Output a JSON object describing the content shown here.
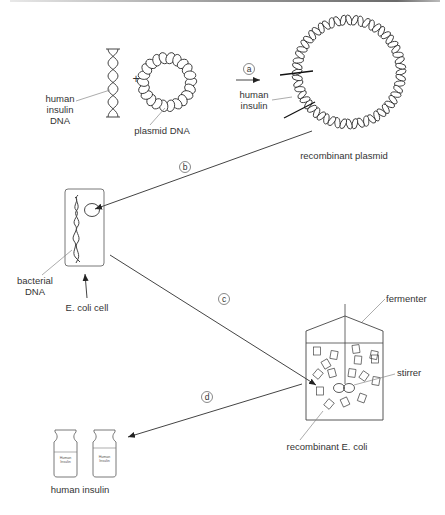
{
  "diagram": {
    "type": "process-flow",
    "colors": {
      "line": "#444444",
      "text": "#333333",
      "leader": "#888888",
      "background": "#ffffff"
    },
    "labels": {
      "human_insulin_dna": [
        "human",
        "insulin",
        "DNA"
      ],
      "plus": "+",
      "plasmid_dna": "plasmid DNA",
      "human_insulin_insert": [
        "human",
        "insulin"
      ],
      "recombinant_plasmid": "recombinant plasmid",
      "bacterial_dna": [
        "bacterial",
        "DNA"
      ],
      "e_coli_cell": "E. coli cell",
      "fermenter": "fermenter",
      "stirrer": "stirrer",
      "recombinant_e_coli": "recombinant E. coli",
      "human_insulin_product": "human insulin",
      "bottle_label": [
        "Human",
        "Insulin"
      ]
    },
    "steps": [
      {
        "id": "a",
        "label": "a",
        "from": "human insulin DNA + plasmid DNA",
        "to": "recombinant plasmid"
      },
      {
        "id": "b",
        "label": "b",
        "from": "recombinant plasmid",
        "to": "E. coli cell"
      },
      {
        "id": "c",
        "label": "c",
        "from": "E. coli cell",
        "to": "fermenter"
      },
      {
        "id": "d",
        "label": "d",
        "from": "fermenter",
        "to": "human insulin"
      }
    ]
  }
}
